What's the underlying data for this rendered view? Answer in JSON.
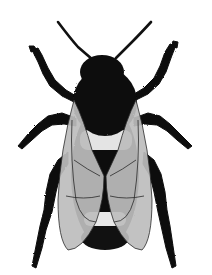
{
  "image": {
    "subject": "Illustration of a bumblebee, dorsal view",
    "style": "black and white engraving-style illustration",
    "colors": {
      "background": "#ffffff",
      "body": "#111111",
      "band": "#e8e8e8",
      "wing": "#bdbdbd",
      "wing_vein": "#2a2a2a"
    }
  }
}
